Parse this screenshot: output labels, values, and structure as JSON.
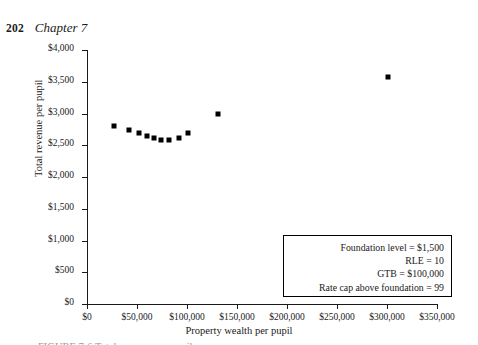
{
  "page": {
    "folio": "202",
    "chapter": "Chapter 7"
  },
  "chart_data": {
    "type": "scatter",
    "title": "",
    "xlabel": "Property wealth per pupil",
    "ylabel": "Total revenue per pupil",
    "xlim": [
      0,
      350000
    ],
    "ylim": [
      0,
      4000
    ],
    "grid": false,
    "legend": "none",
    "xticks": [
      0,
      50000,
      100000,
      150000,
      200000,
      250000,
      300000,
      350000
    ],
    "xtick_labels": [
      "$0",
      "$50,000",
      "$100,000",
      "$150,000",
      "$200,000",
      "$250,000",
      "$300,000",
      "$350,000"
    ],
    "yticks": [
      0,
      500,
      1000,
      1500,
      2000,
      2500,
      3000,
      3500,
      4000
    ],
    "ytick_labels": [
      "$0",
      "$500",
      "$1,000",
      "$1,500",
      "$2,000",
      "$2,500",
      "$3,000",
      "$3,500",
      "$4,000"
    ],
    "marker": "square",
    "marker_color": "#000000",
    "points": [
      {
        "x": 27000,
        "y": 2800
      },
      {
        "x": 42000,
        "y": 2740
      },
      {
        "x": 52000,
        "y": 2690
      },
      {
        "x": 60000,
        "y": 2650
      },
      {
        "x": 67000,
        "y": 2620
      },
      {
        "x": 74000,
        "y": 2590
      },
      {
        "x": 82000,
        "y": 2580
      },
      {
        "x": 92000,
        "y": 2610
      },
      {
        "x": 101000,
        "y": 2690
      },
      {
        "x": 131000,
        "y": 3000
      },
      {
        "x": 301000,
        "y": 3570
      }
    ],
    "annotation": {
      "lines": [
        "Foundation level = $1,500",
        "RLE = 10",
        "GTB = $100,000",
        "Rate cap above foundation = 99"
      ]
    }
  },
  "caption": {
    "text": "FIGURE 7-6  Total revenue per pupil"
  }
}
